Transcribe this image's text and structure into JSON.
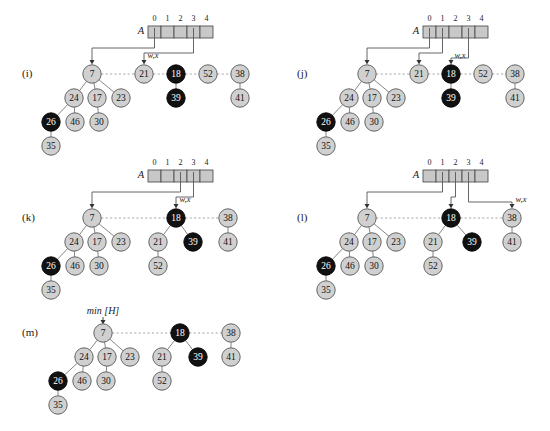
{
  "figure": {
    "background": "#ffffff",
    "node_fill_light": "#d0d0d0",
    "node_fill_dark": "#111111",
    "node_stroke": "#555555",
    "array_fill": "#c8c8c8",
    "array_stroke": "#4a4a4a",
    "pointer_color": "#555555",
    "sibling_link_color": "#999999",
    "child_link_color": "#777777"
  },
  "labels": {
    "array_name": "A",
    "wx": "w,x",
    "min_h": "min [H]",
    "indices": [
      "0",
      "1",
      "2",
      "3",
      "4"
    ]
  },
  "panels": [
    {
      "id": "i",
      "label": "(i)",
      "label_x": 22,
      "label_y": 74,
      "array": {
        "x": 148,
        "y": 26,
        "cell_w": 13,
        "cell_h": 12,
        "name_x": 141,
        "name_y": 32,
        "pointers": [
          {
            "index": 0,
            "target_x": 92,
            "target_y": 62,
            "label": null
          },
          {
            "index": 3,
            "target_x": 144,
            "target_y": 62,
            "label": "w,x"
          }
        ]
      },
      "roots": [
        {
          "value": "7",
          "x": 92,
          "y": 74,
          "dark": false
        },
        {
          "value": "21",
          "x": 144,
          "y": 74,
          "dark": false
        },
        {
          "value": "18",
          "x": 176,
          "y": 74,
          "dark": true
        },
        {
          "value": "52",
          "x": 208,
          "y": 74,
          "dark": false
        },
        {
          "value": "38",
          "x": 240,
          "y": 74,
          "dark": false
        }
      ],
      "nodes": [
        {
          "value": "24",
          "x": 74,
          "y": 98,
          "dark": false
        },
        {
          "value": "17",
          "x": 97,
          "y": 98,
          "dark": false
        },
        {
          "value": "23",
          "x": 121,
          "y": 98,
          "dark": false
        },
        {
          "value": "26",
          "x": 51,
          "y": 122,
          "dark": true
        },
        {
          "value": "46",
          "x": 75,
          "y": 122,
          "dark": false
        },
        {
          "value": "30",
          "x": 99,
          "y": 122,
          "dark": false
        },
        {
          "value": "35",
          "x": 51,
          "y": 146,
          "dark": false
        },
        {
          "value": "39",
          "x": 176,
          "y": 98,
          "dark": true
        },
        {
          "value": "41",
          "x": 240,
          "y": 98,
          "dark": false
        }
      ],
      "child_links": [
        [
          92,
          74,
          74,
          98
        ],
        [
          92,
          74,
          97,
          98
        ],
        [
          92,
          74,
          121,
          98
        ],
        [
          74,
          98,
          51,
          122
        ],
        [
          74,
          98,
          75,
          122
        ],
        [
          97,
          98,
          99,
          122
        ],
        [
          51,
          122,
          51,
          146
        ],
        [
          176,
          74,
          176,
          98
        ],
        [
          240,
          74,
          240,
          98
        ]
      ],
      "sibling_links": [
        [
          92,
          74,
          144,
          74
        ],
        [
          144,
          74,
          176,
          74
        ],
        [
          176,
          74,
          208,
          74
        ],
        [
          208,
          74,
          240,
          74
        ]
      ]
    },
    {
      "id": "j",
      "label": "(j)",
      "label_x": 297,
      "label_y": 74,
      "array": {
        "x": 423,
        "y": 26,
        "cell_w": 13,
        "cell_h": 12,
        "name_x": 416,
        "name_y": 32,
        "pointers": [
          {
            "index": 0,
            "target_x": 367,
            "target_y": 62,
            "label": null
          },
          {
            "index": 1,
            "target_x": 419,
            "target_y": 62,
            "label": null
          },
          {
            "index": 3,
            "target_x": 451,
            "target_y": 62,
            "label": "w,x"
          }
        ]
      },
      "roots": [
        {
          "value": "7",
          "x": 367,
          "y": 74,
          "dark": false
        },
        {
          "value": "21",
          "x": 419,
          "y": 74,
          "dark": false
        },
        {
          "value": "18",
          "x": 451,
          "y": 74,
          "dark": true
        },
        {
          "value": "52",
          "x": 483,
          "y": 74,
          "dark": false
        },
        {
          "value": "38",
          "x": 515,
          "y": 74,
          "dark": false
        }
      ],
      "nodes": [
        {
          "value": "24",
          "x": 349,
          "y": 98,
          "dark": false
        },
        {
          "value": "17",
          "x": 372,
          "y": 98,
          "dark": false
        },
        {
          "value": "23",
          "x": 396,
          "y": 98,
          "dark": false
        },
        {
          "value": "26",
          "x": 326,
          "y": 122,
          "dark": true
        },
        {
          "value": "46",
          "x": 350,
          "y": 122,
          "dark": false
        },
        {
          "value": "30",
          "x": 374,
          "y": 122,
          "dark": false
        },
        {
          "value": "35",
          "x": 326,
          "y": 146,
          "dark": false
        },
        {
          "value": "39",
          "x": 451,
          "y": 98,
          "dark": true
        },
        {
          "value": "41",
          "x": 515,
          "y": 98,
          "dark": false
        }
      ],
      "child_links": [
        [
          367,
          74,
          349,
          98
        ],
        [
          367,
          74,
          372,
          98
        ],
        [
          367,
          74,
          396,
          98
        ],
        [
          349,
          98,
          326,
          122
        ],
        [
          349,
          98,
          350,
          122
        ],
        [
          372,
          98,
          374,
          122
        ],
        [
          326,
          122,
          326,
          146
        ],
        [
          451,
          74,
          451,
          98
        ],
        [
          515,
          74,
          515,
          98
        ]
      ],
      "sibling_links": [
        [
          367,
          74,
          419,
          74
        ],
        [
          419,
          74,
          451,
          74
        ],
        [
          451,
          74,
          483,
          74
        ],
        [
          483,
          74,
          515,
          74
        ]
      ]
    },
    {
      "id": "k",
      "label": "(k)",
      "label_x": 22,
      "label_y": 218,
      "array": {
        "x": 148,
        "y": 170,
        "cell_w": 13,
        "cell_h": 12,
        "name_x": 141,
        "name_y": 176,
        "pointers": [
          {
            "index": 2,
            "target_x": 92,
            "target_y": 206,
            "label": null
          },
          {
            "index": 3,
            "target_x": 176,
            "target_y": 206,
            "label": "w,x"
          }
        ]
      },
      "roots": [
        {
          "value": "7",
          "x": 92,
          "y": 218,
          "dark": false
        },
        {
          "value": "18",
          "x": 176,
          "y": 218,
          "dark": true
        },
        {
          "value": "38",
          "x": 228,
          "y": 218,
          "dark": false
        }
      ],
      "nodes": [
        {
          "value": "24",
          "x": 74,
          "y": 242,
          "dark": false
        },
        {
          "value": "17",
          "x": 97,
          "y": 242,
          "dark": false
        },
        {
          "value": "23",
          "x": 121,
          "y": 242,
          "dark": false
        },
        {
          "value": "26",
          "x": 51,
          "y": 266,
          "dark": true
        },
        {
          "value": "46",
          "x": 75,
          "y": 266,
          "dark": false
        },
        {
          "value": "30",
          "x": 99,
          "y": 266,
          "dark": false
        },
        {
          "value": "35",
          "x": 51,
          "y": 290,
          "dark": false
        },
        {
          "value": "21",
          "x": 158,
          "y": 242,
          "dark": false
        },
        {
          "value": "39",
          "x": 193,
          "y": 242,
          "dark": true
        },
        {
          "value": "52",
          "x": 158,
          "y": 266,
          "dark": false
        },
        {
          "value": "41",
          "x": 228,
          "y": 242,
          "dark": false
        }
      ],
      "child_links": [
        [
          92,
          218,
          74,
          242
        ],
        [
          92,
          218,
          97,
          242
        ],
        [
          92,
          218,
          121,
          242
        ],
        [
          74,
          242,
          51,
          266
        ],
        [
          74,
          242,
          75,
          266
        ],
        [
          97,
          242,
          99,
          266
        ],
        [
          51,
          266,
          51,
          290
        ],
        [
          176,
          218,
          158,
          242
        ],
        [
          176,
          218,
          193,
          242
        ],
        [
          158,
          242,
          158,
          266
        ],
        [
          228,
          218,
          228,
          242
        ]
      ],
      "sibling_links": [
        [
          92,
          218,
          176,
          218
        ],
        [
          176,
          218,
          228,
          218
        ]
      ]
    },
    {
      "id": "l",
      "label": "(l)",
      "label_x": 297,
      "label_y": 218,
      "array": {
        "x": 423,
        "y": 170,
        "cell_w": 13,
        "cell_h": 12,
        "name_x": 416,
        "name_y": 176,
        "pointers": [
          {
            "index": 1,
            "target_x": 367,
            "target_y": 206,
            "label": null
          },
          {
            "index": 2,
            "target_x": 451,
            "target_y": 206,
            "label": null
          },
          {
            "index": 3,
            "target_x": 512,
            "target_y": 206,
            "label": "w,x"
          }
        ]
      },
      "roots": [
        {
          "value": "7",
          "x": 367,
          "y": 218,
          "dark": false
        },
        {
          "value": "18",
          "x": 451,
          "y": 218,
          "dark": true
        },
        {
          "value": "38",
          "x": 512,
          "y": 218,
          "dark": false
        }
      ],
      "nodes": [
        {
          "value": "24",
          "x": 349,
          "y": 242,
          "dark": false
        },
        {
          "value": "17",
          "x": 372,
          "y": 242,
          "dark": false
        },
        {
          "value": "23",
          "x": 396,
          "y": 242,
          "dark": false
        },
        {
          "value": "26",
          "x": 326,
          "y": 266,
          "dark": true
        },
        {
          "value": "46",
          "x": 350,
          "y": 266,
          "dark": false
        },
        {
          "value": "30",
          "x": 374,
          "y": 266,
          "dark": false
        },
        {
          "value": "35",
          "x": 326,
          "y": 290,
          "dark": false
        },
        {
          "value": "21",
          "x": 433,
          "y": 242,
          "dark": false
        },
        {
          "value": "39",
          "x": 472,
          "y": 242,
          "dark": true
        },
        {
          "value": "52",
          "x": 433,
          "y": 266,
          "dark": false
        },
        {
          "value": "41",
          "x": 512,
          "y": 242,
          "dark": false
        }
      ],
      "child_links": [
        [
          367,
          218,
          349,
          242
        ],
        [
          367,
          218,
          372,
          242
        ],
        [
          367,
          218,
          396,
          242
        ],
        [
          349,
          242,
          326,
          266
        ],
        [
          349,
          242,
          350,
          266
        ],
        [
          372,
          242,
          374,
          266
        ],
        [
          326,
          266,
          326,
          290
        ],
        [
          451,
          218,
          433,
          242
        ],
        [
          451,
          218,
          472,
          242
        ],
        [
          433,
          242,
          433,
          266
        ],
        [
          512,
          218,
          512,
          242
        ]
      ],
      "sibling_links": [
        [
          367,
          218,
          451,
          218
        ],
        [
          451,
          218,
          512,
          218
        ]
      ]
    },
    {
      "id": "m",
      "label": "(m)",
      "label_x": 22,
      "label_y": 333,
      "min_pointer": {
        "label": "min [H]",
        "label_x": 103,
        "label_y": 312,
        "target_x": 103,
        "target_y": 322
      },
      "roots": [
        {
          "value": "7",
          "x": 103,
          "y": 333,
          "dark": false
        },
        {
          "value": "18",
          "x": 180,
          "y": 333,
          "dark": true
        },
        {
          "value": "38",
          "x": 231,
          "y": 333,
          "dark": false
        }
      ],
      "nodes": [
        {
          "value": "24",
          "x": 84,
          "y": 357,
          "dark": false
        },
        {
          "value": "17",
          "x": 107,
          "y": 357,
          "dark": false
        },
        {
          "value": "23",
          "x": 130,
          "y": 357,
          "dark": false
        },
        {
          "value": "26",
          "x": 58,
          "y": 381,
          "dark": true
        },
        {
          "value": "46",
          "x": 82,
          "y": 381,
          "dark": false
        },
        {
          "value": "30",
          "x": 106,
          "y": 381,
          "dark": false
        },
        {
          "value": "35",
          "x": 58,
          "y": 405,
          "dark": false
        },
        {
          "value": "21",
          "x": 162,
          "y": 357,
          "dark": false
        },
        {
          "value": "39",
          "x": 198,
          "y": 357,
          "dark": true
        },
        {
          "value": "52",
          "x": 162,
          "y": 381,
          "dark": false
        },
        {
          "value": "41",
          "x": 231,
          "y": 357,
          "dark": false
        }
      ],
      "child_links": [
        [
          103,
          333,
          84,
          357
        ],
        [
          103,
          333,
          107,
          357
        ],
        [
          103,
          333,
          130,
          357
        ],
        [
          84,
          357,
          58,
          381
        ],
        [
          84,
          357,
          82,
          381
        ],
        [
          107,
          357,
          106,
          381
        ],
        [
          58,
          381,
          58,
          405
        ],
        [
          180,
          333,
          162,
          357
        ],
        [
          180,
          333,
          198,
          357
        ],
        [
          162,
          357,
          162,
          381
        ],
        [
          231,
          333,
          231,
          357
        ]
      ],
      "sibling_links": [
        [
          103,
          333,
          180,
          333
        ],
        [
          180,
          333,
          231,
          333
        ]
      ]
    }
  ]
}
